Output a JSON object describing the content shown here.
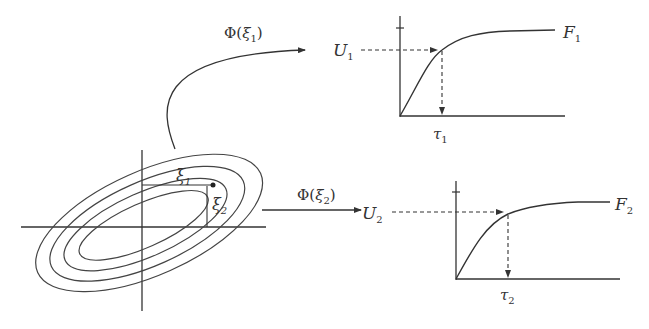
{
  "diagram": {
    "type": "mapping-diagram",
    "stroke_color": "#333333",
    "background": "#ffffff",
    "ellipse_panel": {
      "labels": {
        "xi1": {
          "base": "ξ",
          "sub": "1"
        },
        "xi2": {
          "base": "ξ",
          "sub": "2"
        }
      },
      "contour_count": 4
    },
    "arrows": [
      {
        "id": "phi-xi1",
        "label_prefix": "Φ(",
        "label_var": "ξ",
        "label_sub": "1",
        "label_suffix": ")"
      },
      {
        "id": "phi-xi2",
        "label_prefix": "Φ(",
        "label_var": "ξ",
        "label_sub": "2",
        "label_suffix": ")"
      }
    ],
    "cdf_panels": [
      {
        "curve_label": "F",
        "curve_sub": "1",
        "u_label": "U",
        "u_sub": "1",
        "tau_label": "τ",
        "tau_sub": "1"
      },
      {
        "curve_label": "F",
        "curve_sub": "2",
        "u_label": "U",
        "u_sub": "2",
        "tau_label": "τ",
        "tau_sub": "2"
      }
    ]
  }
}
